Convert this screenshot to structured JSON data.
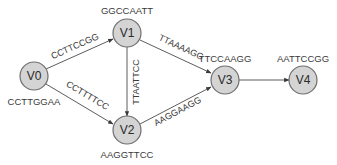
{
  "diagram": {
    "type": "directed-graph",
    "colors": {
      "node_fill": "#d4d4d4",
      "node_stroke": "#6e6e6e",
      "edge": "#4a4a4a",
      "text": "#2a2a2a"
    },
    "nodes": [
      {
        "id": "V0",
        "label": "V0",
        "sequence": "CCTTGGAA"
      },
      {
        "id": "V1",
        "label": "V1",
        "sequence": "GGCCAATT"
      },
      {
        "id": "V2",
        "label": "V2",
        "sequence": "AAGGTTCC"
      },
      {
        "id": "V3",
        "label": "V3",
        "sequence": "TTCCAAGG"
      },
      {
        "id": "V4",
        "label": "V4",
        "sequence": "AATTCCGG"
      }
    ],
    "edges": [
      {
        "from": "V0",
        "to": "V1",
        "label": "CCTTCCGG"
      },
      {
        "from": "V0",
        "to": "V2",
        "label": "CCTTTTCC"
      },
      {
        "from": "V1",
        "to": "V2",
        "label": "TTAATTCC"
      },
      {
        "from": "V1",
        "to": "V3",
        "label": "TTAAAAGG"
      },
      {
        "from": "V2",
        "to": "V3",
        "label": "AAGGAAGG"
      },
      {
        "from": "V3",
        "to": "V4",
        "label": ""
      }
    ]
  }
}
